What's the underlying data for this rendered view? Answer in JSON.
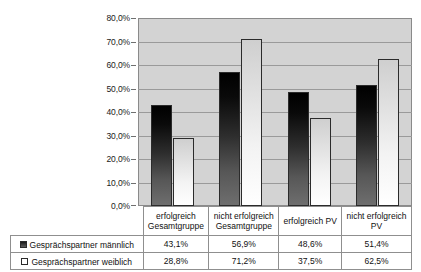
{
  "chart_data": {
    "type": "bar",
    "title": "",
    "xlabel": "",
    "ylabel": "",
    "ylim": [
      0,
      80
    ],
    "grid": true,
    "legend_position": "bottom-table",
    "categories": [
      "erfolgreich Gesamtgruppe",
      "nicht erfolgreich Gesamtgruppe",
      "erfolgreich PV",
      "nicht erfolgreich PV"
    ],
    "category_lines": [
      [
        "erfolgreich",
        "Gesamtgruppe"
      ],
      [
        "nicht erfolgreich",
        "Gesamtgruppe"
      ],
      [
        "erfolgreich PV",
        ""
      ],
      [
        "nicht erfolgreich",
        "PV"
      ]
    ],
    "series": [
      {
        "name": "Gesprächspartner männlich",
        "values": [
          43.1,
          56.9,
          48.6,
          51.4
        ],
        "labels": [
          "43,1%",
          "56,9%",
          "48,6%",
          "51,4%"
        ],
        "color": "#1a1a1a"
      },
      {
        "name": "Gesprächspartner weiblich",
        "values": [
          28.8,
          71.2,
          37.5,
          62.5
        ],
        "labels": [
          "28,8%",
          "71,2%",
          "37,5%",
          "62,5%"
        ],
        "color": "#ffffff"
      }
    ],
    "yticks": [
      80,
      70,
      60,
      50,
      40,
      30,
      20,
      10,
      0
    ],
    "ytick_labels": [
      "80,0%",
      "70,0%",
      "60,0%",
      "50,0%",
      "40,0%",
      "30,0%",
      "20,0%",
      "10,0%",
      "0,0%"
    ]
  },
  "colors": {
    "plot_background": "#d3d3d3",
    "gridline": "#9a9a9a",
    "axis": "#8a8a8a",
    "bar_male": "#1a1a1a",
    "bar_female": "#ffffff",
    "table_border": "#8f8f8f",
    "text": "#111111"
  }
}
